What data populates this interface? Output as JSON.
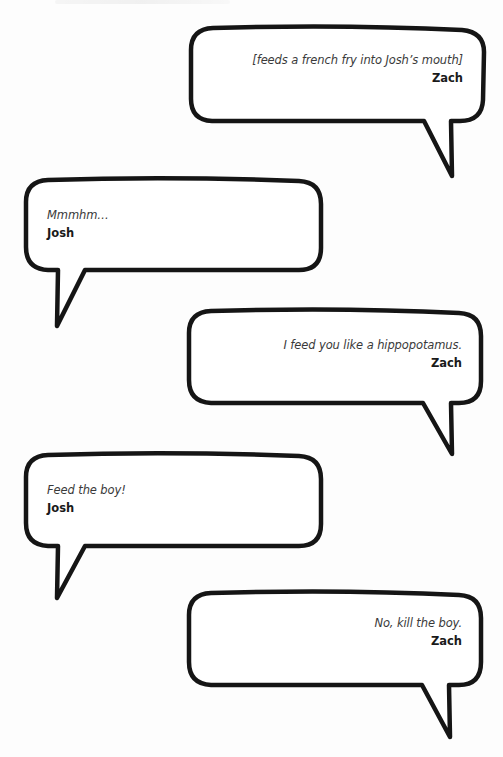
{
  "page": {
    "background": "#fdfdfd",
    "stroke_color": "#151515",
    "text_color": "#3a3a3a"
  },
  "bubbles": [
    {
      "side": "right",
      "line": "[feeds a french fry into Josh’s mouth]",
      "speaker": "Zach"
    },
    {
      "side": "left",
      "line": "Mmmhm…",
      "speaker": "Josh"
    },
    {
      "side": "right",
      "line": "I feed you like a hippopotamus.",
      "speaker": "Zach"
    },
    {
      "side": "left",
      "line": "Feed the boy!",
      "speaker": "Josh"
    },
    {
      "side": "right",
      "line": "No, kill the boy.",
      "speaker": "Zach"
    }
  ]
}
